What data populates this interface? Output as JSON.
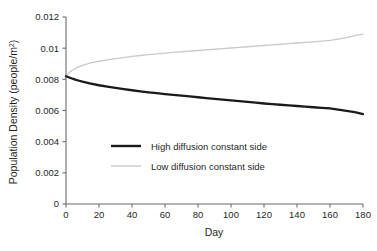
{
  "chart_data": {
    "type": "line",
    "title": "",
    "xlabel": "Day",
    "ylabel": "Population Density (people/m²)",
    "ylabel_main": "Population Density (people/m",
    "ylabel_sup": "2",
    "ylabel_tail": ")",
    "xlim": [
      0,
      180
    ],
    "ylim": [
      0,
      0.012
    ],
    "grid": false,
    "legend_position": "center",
    "x_ticks": [
      0,
      20,
      40,
      60,
      80,
      100,
      120,
      140,
      160,
      180
    ],
    "x_tick_labels": [
      "0",
      "20",
      "40",
      "60",
      "80",
      "100",
      "120",
      "140",
      "160",
      "180"
    ],
    "y_ticks": [
      0,
      0.002,
      0.004,
      0.006,
      0.008,
      0.01,
      0.012
    ],
    "y_tick_labels": [
      "0",
      "0.002",
      "0.004",
      "0.006",
      "0.008",
      "0.01",
      "0.012"
    ],
    "x": [
      0,
      2,
      4,
      6,
      8,
      10,
      15,
      20,
      25,
      30,
      35,
      40,
      45,
      50,
      55,
      60,
      65,
      70,
      75,
      80,
      85,
      90,
      95,
      100,
      105,
      110,
      115,
      120,
      125,
      130,
      135,
      140,
      145,
      150,
      155,
      160,
      165,
      170,
      175,
      180
    ],
    "series": [
      {
        "name": "High diffusion constant side",
        "color": "#1a1a1a",
        "line_width": 2.3,
        "values": [
          0.0082,
          0.00812,
          0.00804,
          0.00797,
          0.00791,
          0.00785,
          0.00773,
          0.00762,
          0.00753,
          0.00745,
          0.00737,
          0.0073,
          0.00723,
          0.00717,
          0.00711,
          0.00705,
          0.007,
          0.00695,
          0.0069,
          0.00685,
          0.0068,
          0.00675,
          0.0067,
          0.00665,
          0.0066,
          0.00655,
          0.0065,
          0.00645,
          0.00641,
          0.00637,
          0.00633,
          0.00629,
          0.00625,
          0.00621,
          0.00617,
          0.00613,
          0.00605,
          0.00598,
          0.0059,
          0.00577
        ]
      },
      {
        "name": "Low diffusion constant side",
        "color": "#c9c9c9",
        "line_width": 1.3,
        "values": [
          0.0082,
          0.00843,
          0.0086,
          0.00872,
          0.00882,
          0.0089,
          0.00905,
          0.00916,
          0.00925,
          0.00933,
          0.0094,
          0.00947,
          0.00953,
          0.00958,
          0.00963,
          0.00968,
          0.00973,
          0.00977,
          0.00981,
          0.00985,
          0.00989,
          0.00993,
          0.00997,
          0.01001,
          0.01005,
          0.01009,
          0.01013,
          0.01017,
          0.01021,
          0.01025,
          0.01029,
          0.01033,
          0.01037,
          0.01041,
          0.01045,
          0.0105,
          0.01058,
          0.01068,
          0.0108,
          0.0109
        ]
      }
    ]
  },
  "legend": {
    "entries": [
      {
        "label": "High diffusion constant side"
      },
      {
        "label": "Low diffusion constant side"
      }
    ]
  },
  "colors": {
    "axis": "#6b6b6b",
    "text": "#1f1f1f",
    "high_diffusion": "#1a1a1a",
    "low_diffusion": "#c9c9c9",
    "background": "#ffffff"
  }
}
